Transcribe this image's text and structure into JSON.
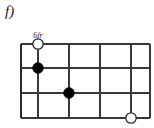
{
  "figure": {
    "item_label": "f)",
    "type": "chord-diagram",
    "orientation": "horizontal"
  },
  "diagram": {
    "fret_position_label": "6fr",
    "string_count": 4,
    "fret_count": 5,
    "grid": {
      "left": 21,
      "right": 150,
      "top": 44,
      "bottom": 118,
      "string_y": [
        44,
        68,
        93,
        118
      ],
      "fret_x": [
        21,
        38,
        69,
        100,
        131,
        150
      ]
    },
    "markers": [
      {
        "name": "open-circle-marker-1",
        "kind": "open",
        "cx": 38,
        "cy": 44,
        "r": 5.2
      },
      {
        "name": "filled-dot-marker-1",
        "kind": "filled",
        "cx": 38,
        "cy": 68,
        "r": 5.4
      },
      {
        "name": "filled-dot-marker-2",
        "kind": "filled",
        "cx": 69,
        "cy": 93,
        "r": 5.4
      },
      {
        "name": "open-circle-marker-2",
        "kind": "open",
        "cx": 131,
        "cy": 118,
        "r": 5.2
      }
    ],
    "colors": {
      "line": "#3a3a3a",
      "filled_dot": "#000000",
      "open_dot_fill": "#ffffff",
      "open_dot_stroke": "#2b2b2b",
      "text": "#1a1a1a",
      "background": "#ffffff"
    }
  }
}
